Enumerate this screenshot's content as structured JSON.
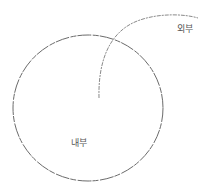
{
  "diagram": {
    "labels": {
      "inside": "내부",
      "outside": "외부"
    },
    "colors": {
      "background": "#ffffff",
      "stroke": "#6b6b6b",
      "curve_stroke": "#8a8a8a",
      "text": "#555555"
    },
    "shapes": {
      "circle": {
        "cx": 88,
        "cy": 108,
        "rx": 75,
        "ry": 73
      },
      "curve": {
        "start": [
          99,
          98
        ],
        "end": [
          198,
          18
        ]
      }
    }
  }
}
